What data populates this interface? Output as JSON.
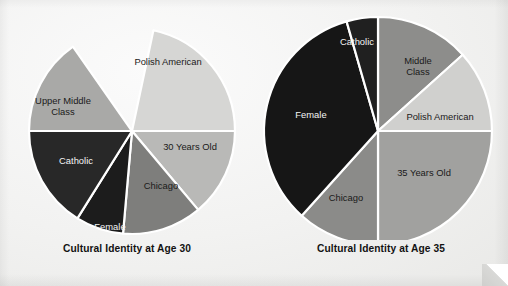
{
  "figure": {
    "background_color": "#f1f1ef",
    "label_text_color": "#1a1a1a",
    "label_text_color_on_dark": "#f4f4f4",
    "separator_color": "#ffffff"
  },
  "chart_data": [
    {
      "type": "pie",
      "title": "Cultural Identity at Age 30",
      "id": "age-30",
      "center": [
        132,
        131
      ],
      "radius": 103,
      "start_angle_deg": 12,
      "legend": "none",
      "categories": [
        "Polish American",
        "30 Years Old",
        "Chicago",
        "Female",
        "Catholic",
        "Upper Middle Class"
      ],
      "values": [
        21.5,
        14.0,
        12.5,
        7.5,
        16.0,
        15.5
      ],
      "labels": [
        "Polish American",
        "30 Years Old",
        "Chicago",
        "Female",
        "Catholic",
        "Upper Middle Class"
      ],
      "slices": [
        {
          "label": "Polish American",
          "start_deg": 12,
          "end_deg": 90,
          "color": "#d6d6d4",
          "label_x": 168,
          "label_y": 63,
          "dark": false,
          "lines": [
            "Polish American"
          ]
        },
        {
          "label": "30 Years Old",
          "start_deg": 90,
          "end_deg": 140,
          "color": "#b9b9b7",
          "label_x": 190,
          "label_y": 148,
          "dark": false,
          "lines": [
            "30 Years Old"
          ]
        },
        {
          "label": "Chicago",
          "start_deg": 140,
          "end_deg": 185,
          "color": "#7e7e7c",
          "label_x": 161,
          "label_y": 187,
          "dark": false,
          "lines": [
            "Chicago"
          ]
        },
        {
          "label": "Female",
          "start_deg": 185,
          "end_deg": 212,
          "color": "#1c1c1c",
          "label_x": 110,
          "label_y": 228,
          "dark": true,
          "lines": [
            "Female"
          ]
        },
        {
          "label": "Catholic",
          "start_deg": 212,
          "end_deg": 270,
          "color": "#282828",
          "label_x": 76,
          "label_y": 162,
          "dark": true,
          "lines": [
            "Catholic"
          ]
        },
        {
          "label": "Upper Middle Class",
          "start_deg": 270,
          "end_deg": 325,
          "color": "#a9a9a7",
          "label_x": 63,
          "label_y": 107,
          "dark": false,
          "lines": [
            "Upper Middle",
            "Class"
          ]
        }
      ]
    },
    {
      "type": "pie",
      "title": "Cultural Identity at Age 35",
      "id": "age-35",
      "center": [
        124,
        131
      ],
      "radius": 114,
      "start_angle_deg": 0,
      "legend": "none",
      "categories": [
        "Middle Class",
        "Polish American",
        "35 Years Old",
        "Chicago",
        "Female",
        "Catholic"
      ],
      "values": [
        13.5,
        11.5,
        25.0,
        11.5,
        34.0,
        4.5
      ],
      "labels": [
        "Middle Class",
        "Polish American",
        "35 Years Old",
        "Chicago",
        "Female",
        "Catholic"
      ],
      "slices": [
        {
          "label": "Middle Class",
          "start_deg": 0,
          "end_deg": 48,
          "color": "#8d8d8b",
          "label_x": 164,
          "label_y": 67,
          "dark": false,
          "lines": [
            "Middle",
            "Class"
          ]
        },
        {
          "label": "Polish American",
          "start_deg": 48,
          "end_deg": 90,
          "color": "#d0d0ce",
          "label_x": 186,
          "label_y": 118,
          "dark": false,
          "lines": [
            "Polish American"
          ]
        },
        {
          "label": "35 Years Old",
          "start_deg": 90,
          "end_deg": 180,
          "color": "#a1a19f",
          "label_x": 170,
          "label_y": 174,
          "dark": false,
          "lines": [
            "35 Years Old"
          ]
        },
        {
          "label": "Chicago",
          "start_deg": 180,
          "end_deg": 222,
          "color": "#8b8b89",
          "label_x": 92,
          "label_y": 199,
          "dark": false,
          "lines": [
            "Chicago"
          ]
        },
        {
          "label": "Female",
          "start_deg": 222,
          "end_deg": 344,
          "color": "#161616",
          "label_x": 57,
          "label_y": 116,
          "dark": true,
          "lines": [
            "Female"
          ]
        },
        {
          "label": "Catholic",
          "start_deg": 344,
          "end_deg": 360,
          "color": "#202020",
          "label_x": 103,
          "label_y": 43,
          "dark": true,
          "lines": [
            "Catholic"
          ]
        }
      ]
    }
  ]
}
